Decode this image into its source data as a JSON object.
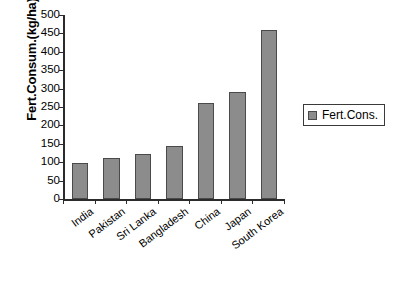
{
  "chart_data": {
    "type": "bar",
    "title": "",
    "xlabel": "",
    "ylabel": "Fert.Consum.(kg/ha)",
    "ylim": [
      0,
      500
    ],
    "ytick_step": 50,
    "yticks": [
      0,
      50,
      100,
      150,
      200,
      250,
      300,
      350,
      400,
      450,
      500
    ],
    "grid": false,
    "legend_position": "right",
    "categories": [
      "India",
      "Pakistan",
      "Sri Lanka",
      "Bangladesh",
      "China",
      "Japan",
      "South Korea"
    ],
    "series": [
      {
        "name": "Fert.Cons.",
        "values": [
          98,
          112,
          123,
          143,
          260,
          292,
          460
        ]
      }
    ]
  },
  "legend": {
    "entries": [
      {
        "label": "Fert.Cons."
      }
    ]
  },
  "colors": {
    "bar_fill": "#8c8c8c",
    "bar_border": "#4a4a4a",
    "axis": "#2b2b2b",
    "text": "#000000",
    "background": "#ffffff"
  }
}
